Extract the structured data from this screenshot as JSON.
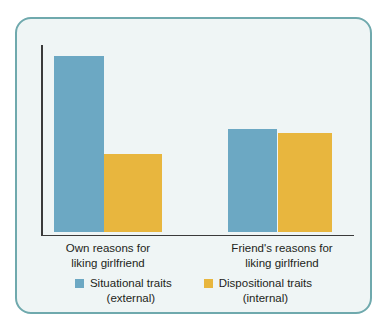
{
  "chart_data": {
    "type": "bar",
    "title": "",
    "subtitle": "",
    "xlabel": "",
    "ylabel": "",
    "grid": false,
    "legend_position": "bottom",
    "axis_tick_labels": [],
    "ylim": [
      0,
      100
    ],
    "categories": [
      "Own reasons for\nliking girlfriend",
      "Friend's reasons for\nliking girlfriend"
    ],
    "series": [
      {
        "name": "Situational traits\n(external)",
        "color": "#6ca8c3",
        "values": [
          93,
          54
        ]
      },
      {
        "name": "Dispositional traits\n(internal)",
        "color": "#e8b63e",
        "values": [
          41,
          52
        ]
      }
    ]
  },
  "categories": {
    "own": "Own reasons for\nliking girlfriend",
    "friend": "Friend's reasons for\nliking girlfriend"
  },
  "legend": {
    "situational": "Situational traits\n(external)",
    "dispositional": "Dispositional traits\n(internal)"
  },
  "colors": {
    "situational": "#6ca8c3",
    "dispositional": "#e8b63e",
    "frame_border": "#6fa9ad",
    "panel_background": "#eff5f5",
    "axis": "#3a3a3a",
    "text": "#231f20"
  }
}
